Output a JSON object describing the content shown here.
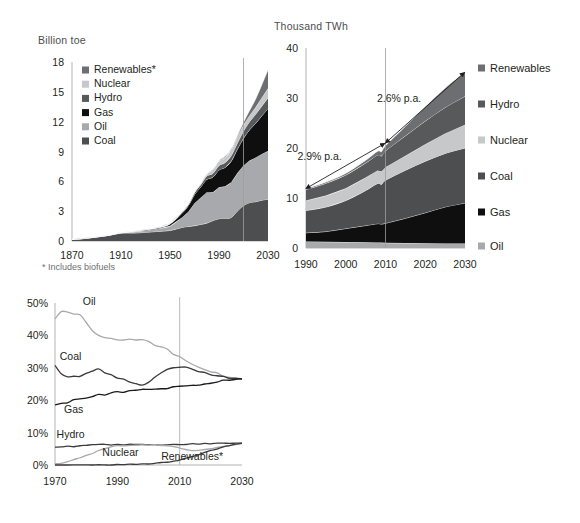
{
  "figure": {
    "palette": {
      "renewables": "#6d6e71",
      "hydro": "#58595b",
      "nuclear": "#c7c8ca",
      "coal": "#4d4e50",
      "gas": "#0f0f0f",
      "oil": "#a7a9ac",
      "axis": "#b3b3b3",
      "text": "#231f20",
      "muted": "#6e6e6e"
    }
  },
  "chart_data": [
    {
      "id": "primary-energy-consumption",
      "type": "area",
      "stacked": true,
      "title": "Billion toe",
      "xlabel": "",
      "ylabel": "Billion toe",
      "xlim": [
        1870,
        2030
      ],
      "ylim": [
        0,
        18
      ],
      "yticks": [
        "0",
        "3",
        "6",
        "9",
        "12",
        "15",
        "18"
      ],
      "ytick_values": [
        0,
        3,
        6,
        9,
        12,
        15,
        18
      ],
      "xticks": [
        "1870",
        "1910",
        "1950",
        "1990",
        "2030"
      ],
      "xtick_values": [
        1870,
        1910,
        1950,
        1990,
        2030
      ],
      "grid": false,
      "legend_position": "inside-top-left",
      "footnote": "* Includes biofuels",
      "forecast_divider_year": 2010,
      "legend": [
        {
          "label": "Renewables*",
          "color": "#6d6e71"
        },
        {
          "label": "Nuclear",
          "color": "#c7c8ca"
        },
        {
          "label": "Hydro",
          "color": "#58595b"
        },
        {
          "label": "Gas",
          "color": "#0f0f0f"
        },
        {
          "label": "Oil",
          "color": "#a7a9ac"
        },
        {
          "label": "Coal",
          "color": "#4d4e50"
        }
      ],
      "x": [
        1870,
        1880,
        1890,
        1900,
        1910,
        1920,
        1930,
        1940,
        1950,
        1960,
        1965,
        1970,
        1975,
        1980,
        1985,
        1990,
        1995,
        2000,
        2005,
        2010,
        2015,
        2020,
        2025,
        2030
      ],
      "series": [
        {
          "name": "Coal",
          "color": "#4d4e50",
          "values": [
            0.16,
            0.26,
            0.4,
            0.55,
            0.78,
            0.8,
            0.85,
            0.95,
            1.05,
            1.35,
            1.45,
            1.55,
            1.65,
            1.8,
            2.05,
            2.25,
            2.25,
            2.35,
            3.0,
            3.55,
            3.85,
            3.95,
            4.1,
            4.2
          ]
        },
        {
          "name": "Oil",
          "color": "#a7a9ac",
          "values": [
            0.0,
            0.01,
            0.02,
            0.03,
            0.06,
            0.12,
            0.2,
            0.28,
            0.48,
            1.05,
            1.5,
            2.25,
            2.7,
            3.1,
            2.85,
            3.15,
            3.25,
            3.55,
            3.85,
            4.05,
            4.25,
            4.45,
            4.65,
            4.85
          ]
        },
        {
          "name": "Gas",
          "color": "#0f0f0f",
          "values": [
            0.0,
            0.0,
            0.0,
            0.01,
            0.01,
            0.02,
            0.06,
            0.09,
            0.17,
            0.42,
            0.58,
            0.85,
            1.05,
            1.3,
            1.5,
            1.75,
            1.9,
            2.15,
            2.4,
            2.75,
            3.1,
            3.45,
            3.85,
            4.25
          ]
        },
        {
          "name": "Hydro",
          "color": "#58595b",
          "values": [
            0.0,
            0.0,
            0.0,
            0.01,
            0.01,
            0.02,
            0.04,
            0.05,
            0.08,
            0.14,
            0.17,
            0.22,
            0.26,
            0.32,
            0.38,
            0.45,
            0.5,
            0.55,
            0.6,
            0.7,
            0.8,
            0.9,
            1.0,
            1.1
          ]
        },
        {
          "name": "Nuclear",
          "color": "#c7c8ca",
          "values": [
            0.0,
            0.0,
            0.0,
            0.0,
            0.0,
            0.0,
            0.0,
            0.0,
            0.0,
            0.01,
            0.02,
            0.05,
            0.12,
            0.18,
            0.35,
            0.45,
            0.53,
            0.58,
            0.62,
            0.63,
            0.65,
            0.72,
            0.82,
            0.95
          ]
        },
        {
          "name": "Renewables*",
          "color": "#6d6e71",
          "values": [
            0.0,
            0.0,
            0.0,
            0.0,
            0.0,
            0.0,
            0.0,
            0.0,
            0.0,
            0.0,
            0.0,
            0.01,
            0.01,
            0.02,
            0.03,
            0.05,
            0.07,
            0.1,
            0.15,
            0.25,
            0.5,
            0.85,
            1.3,
            1.85
          ]
        }
      ]
    },
    {
      "id": "power-generation",
      "type": "area",
      "stacked": true,
      "title": "Thousand TWh",
      "xlabel": "",
      "ylabel": "Thousand TWh",
      "xlim": [
        1990,
        2030
      ],
      "ylim": [
        0,
        40
      ],
      "yticks": [
        "0",
        "10",
        "20",
        "30",
        "40"
      ],
      "ytick_values": [
        0,
        10,
        20,
        30,
        40
      ],
      "xticks": [
        "1990",
        "2000",
        "2010",
        "2020",
        "2030"
      ],
      "xtick_values": [
        1990,
        2000,
        2010,
        2020,
        2030
      ],
      "grid": false,
      "legend_position": "right",
      "forecast_divider_year": 2010,
      "annotations": [
        {
          "text": "2.9% p.a.",
          "from_year": 1990,
          "from_value": 11.9,
          "to_year": 2010,
          "to_value": 21.0
        },
        {
          "text": "2.6% p.a.",
          "from_year": 2010,
          "from_value": 21.0,
          "to_year": 2030,
          "to_value": 35.2
        }
      ],
      "legend": [
        {
          "label": "Renewables",
          "color": "#6d6e71"
        },
        {
          "label": "Hydro",
          "color": "#58595b"
        },
        {
          "label": "Nuclear",
          "color": "#c7c8ca"
        },
        {
          "label": "Coal",
          "color": "#4d4e50"
        },
        {
          "label": "Gas",
          "color": "#0f0f0f"
        },
        {
          "label": "Oil",
          "color": "#a7a9ac"
        }
      ],
      "x": [
        1990,
        1995,
        2000,
        2005,
        2008,
        2009,
        2010,
        2015,
        2020,
        2025,
        2030
      ],
      "series": [
        {
          "name": "Oil",
          "color": "#a7a9ac",
          "values": [
            1.3,
            1.25,
            1.2,
            1.15,
            1.12,
            1.08,
            1.05,
            1.0,
            0.95,
            0.92,
            0.9
          ]
        },
        {
          "name": "Gas",
          "color": "#0f0f0f",
          "values": [
            1.75,
            2.05,
            2.7,
            3.35,
            3.75,
            3.7,
            3.9,
            4.95,
            6.1,
            7.3,
            8.1
          ]
        },
        {
          "name": "Coal",
          "color": "#4d4e50",
          "values": [
            4.45,
            4.9,
            5.6,
            7.0,
            8.05,
            7.95,
            8.6,
            9.6,
            10.3,
            10.7,
            11.0
          ]
        },
        {
          "name": "Nuclear",
          "color": "#c7c8ca",
          "values": [
            2.0,
            2.3,
            2.45,
            2.6,
            2.6,
            2.55,
            2.6,
            2.9,
            3.4,
            4.0,
            4.65
          ]
        },
        {
          "name": "Hydro",
          "color": "#58595b",
          "values": [
            2.2,
            2.45,
            2.65,
            2.9,
            3.1,
            3.15,
            3.3,
            4.0,
            4.65,
            5.2,
            5.7
          ]
        },
        {
          "name": "Renewables",
          "color": "#6d6e71",
          "values": [
            0.2,
            0.25,
            0.35,
            0.55,
            0.75,
            0.85,
            1.0,
            1.9,
            2.9,
            3.9,
            4.85
          ]
        }
      ]
    },
    {
      "id": "fuel-shares-of-primary-energy",
      "type": "line",
      "title": "",
      "xlabel": "",
      "ylabel": "",
      "xlim": [
        1970,
        2030
      ],
      "ylim": [
        0,
        50
      ],
      "yticks": [
        "0%",
        "10%",
        "20%",
        "30%",
        "40%",
        "50%"
      ],
      "ytick_values": [
        0,
        10,
        20,
        30,
        40,
        50
      ],
      "xticks": [
        "1970",
        "1990",
        "2010",
        "2030"
      ],
      "xtick_values": [
        1970,
        1990,
        2010,
        2030
      ],
      "grid": false,
      "legend_position": "inline-labels",
      "forecast_divider_year": 2010,
      "inline_labels": [
        {
          "text": "Oil",
          "year": 1981,
          "value": 49.5
        },
        {
          "text": "Coal",
          "year": 1975,
          "value": 32.5
        },
        {
          "text": "Gas",
          "year": 1976,
          "value": 16.0
        },
        {
          "text": "Hydro",
          "year": 1975,
          "value": 8.2
        },
        {
          "text": "Nuclear",
          "year": 1991,
          "value": 2.7
        },
        {
          "text": "Renewables*",
          "year": 2014,
          "value": 1.4
        }
      ],
      "x": [
        1970,
        1972,
        1974,
        1976,
        1978,
        1980,
        1982,
        1984,
        1986,
        1988,
        1990,
        1992,
        1994,
        1996,
        1998,
        2000,
        2002,
        2004,
        2006,
        2008,
        2010,
        2012,
        2014,
        2016,
        2018,
        2020,
        2022,
        2024,
        2026,
        2028,
        2030
      ],
      "series": [
        {
          "name": "Oil",
          "color": "#a7a9ac",
          "values": [
            45.2,
            47.5,
            47.0,
            46.6,
            46.4,
            44.0,
            41.3,
            39.8,
            39.5,
            39.0,
            38.8,
            38.7,
            38.8,
            38.6,
            38.8,
            38.0,
            37.0,
            36.4,
            35.6,
            34.3,
            33.3,
            32.3,
            31.2,
            30.4,
            29.6,
            28.9,
            28.2,
            27.6,
            27.1,
            26.8,
            26.5
          ]
        },
        {
          "name": "Coal",
          "color": "#3b3b3b",
          "values": [
            30.8,
            28.2,
            27.0,
            27.3,
            27.2,
            28.4,
            29.1,
            29.5,
            28.5,
            28.0,
            27.0,
            26.4,
            25.7,
            25.0,
            24.6,
            25.4,
            27.2,
            28.4,
            29.3,
            29.8,
            30.0,
            30.2,
            29.6,
            29.0,
            28.5,
            28.0,
            27.5,
            27.1,
            26.8,
            26.6,
            26.4
          ]
        },
        {
          "name": "Gas",
          "color": "#1a1a1a",
          "values": [
            18.5,
            19.0,
            19.4,
            20.0,
            20.5,
            20.8,
            21.1,
            21.6,
            21.5,
            22.2,
            22.4,
            22.6,
            22.8,
            22.9,
            23.2,
            23.3,
            23.6,
            23.6,
            23.8,
            24.0,
            24.1,
            24.3,
            24.5,
            24.8,
            25.1,
            25.4,
            25.7,
            26.0,
            26.2,
            26.3,
            26.4
          ]
        },
        {
          "name": "Hydro",
          "color": "#3b3b3b",
          "values": [
            5.5,
            5.5,
            5.9,
            5.7,
            5.9,
            6.0,
            6.2,
            6.3,
            6.3,
            6.2,
            6.3,
            6.2,
            6.4,
            6.4,
            6.4,
            6.3,
            6.2,
            6.2,
            6.3,
            6.3,
            6.4,
            6.4,
            6.5,
            6.5,
            6.6,
            6.6,
            6.7,
            6.7,
            6.7,
            6.7,
            6.8
          ]
        },
        {
          "name": "Nuclear",
          "color": "#a7a9ac",
          "values": [
            0.3,
            0.6,
            1.1,
            1.7,
            2.3,
            2.9,
            3.6,
            4.4,
            5.1,
            5.6,
            5.9,
            6.0,
            6.1,
            6.2,
            6.2,
            6.2,
            6.2,
            6.1,
            6.0,
            5.7,
            5.3,
            4.8,
            4.5,
            4.6,
            4.8,
            5.1,
            5.4,
            5.7,
            6.0,
            6.3,
            6.6
          ]
        },
        {
          "name": "Renewables*",
          "color": "#3b3b3b",
          "values": [
            0.0,
            0.0,
            0.0,
            0.0,
            0.0,
            0.0,
            0.0,
            0.0,
            0.0,
            0.0,
            0.1,
            0.1,
            0.2,
            0.2,
            0.3,
            0.4,
            0.5,
            0.7,
            0.9,
            1.2,
            1.6,
            2.1,
            2.6,
            3.2,
            3.8,
            4.4,
            5.0,
            5.6,
            6.0,
            6.4,
            6.7
          ]
        }
      ]
    }
  ]
}
